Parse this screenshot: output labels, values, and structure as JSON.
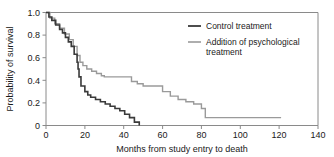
{
  "chart_data": {
    "type": "line",
    "title": "",
    "subtitle": "",
    "xlabel": "Months from study entry to death",
    "ylabel": "Probability of survival",
    "xlim": [
      0,
      140
    ],
    "ylim": [
      0,
      1.0
    ],
    "xticks": [
      0,
      20,
      40,
      60,
      80,
      100,
      120,
      140
    ],
    "xtick_labels": [
      "0",
      "20",
      "40",
      "60",
      "80",
      "100",
      "120",
      "140"
    ],
    "yticks": [
      0,
      0.2,
      0.4,
      0.6,
      0.8,
      1.0
    ],
    "ytick_labels": [
      "0",
      "0.2",
      "0.4",
      "0.6",
      "0.8",
      "1.0"
    ],
    "grid": false,
    "legend_position": "upper right",
    "plot_style": "kaplan-meier step curves",
    "series": [
      {
        "name": "Control treatment",
        "color": "#3a3a3a",
        "step": "post",
        "x": [
          0,
          1.5,
          3,
          5,
          7,
          8.5,
          10,
          11.5,
          13,
          14.5,
          16,
          16.5,
          17,
          18,
          20,
          21.5,
          23,
          25.5,
          28,
          30.5,
          33,
          35.5,
          38,
          40.5,
          43,
          45.5,
          48
        ],
        "y": [
          1.0,
          0.96,
          0.93,
          0.89,
          0.85,
          0.82,
          0.78,
          0.74,
          0.7,
          0.63,
          0.56,
          0.5,
          0.43,
          0.35,
          0.3,
          0.27,
          0.25,
          0.23,
          0.21,
          0.19,
          0.17,
          0.15,
          0.13,
          0.1,
          0.07,
          0.03,
          0.0
        ]
      },
      {
        "name": "Addition of psychological treatment",
        "color": "#9a9a9a",
        "step": "post",
        "x": [
          0,
          2,
          4.5,
          7,
          9.5,
          12,
          14,
          16,
          17.5,
          19,
          21,
          23.5,
          26,
          28.5,
          30,
          35,
          42,
          44,
          47,
          50,
          55,
          60,
          64,
          68,
          72,
          76,
          80,
          82,
          121
        ],
        "y": [
          1.0,
          0.95,
          0.9,
          0.86,
          0.81,
          0.76,
          0.7,
          0.62,
          0.56,
          0.53,
          0.5,
          0.48,
          0.46,
          0.44,
          0.43,
          0.43,
          0.43,
          0.39,
          0.37,
          0.35,
          0.35,
          0.3,
          0.26,
          0.23,
          0.21,
          0.19,
          0.15,
          0.07,
          0.07
        ]
      }
    ],
    "annotations": []
  },
  "legend": {
    "entries": [
      {
        "label": "Control treatment"
      },
      {
        "label": "Addition of psychological",
        "label2": "treatment"
      }
    ]
  }
}
